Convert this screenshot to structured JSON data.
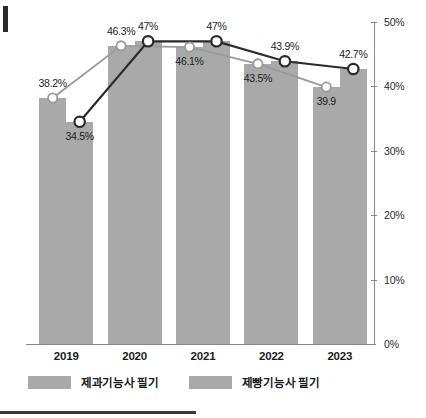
{
  "chart_data": {
    "type": "bar",
    "title": "",
    "subtitle": "",
    "xlabel": "",
    "ylabel": "",
    "categories": [
      "2019",
      "2020",
      "2021",
      "2022",
      "2023"
    ],
    "ylim": [
      0,
      50
    ],
    "ytick_labels": [
      "0%",
      "10%",
      "20%",
      "30%",
      "40%",
      "50%"
    ],
    "ytick_values": [
      0,
      10,
      20,
      30,
      40,
      50
    ],
    "grid": false,
    "legend_position": "bottom-left",
    "series": [
      {
        "name": "제과기능사 필기",
        "color": "#9a9a9a",
        "values": [
          38.2,
          46.3,
          46.1,
          43.5,
          39.9
        ],
        "labels": [
          "38.2%",
          "46.3%",
          "46.1%",
          "43.5%",
          "39.9"
        ]
      },
      {
        "name": "제빵기능사 필기",
        "color": "#2b2b2b",
        "values": [
          34.5,
          47,
          47,
          43.9,
          42.7
        ],
        "labels": [
          "34.5%",
          "47%",
          "47%",
          "43.9%",
          "42.7%"
        ]
      }
    ],
    "bar_color": "#a9a9a9"
  },
  "legend": {
    "items": [
      {
        "label": "제과기능사 필기"
      },
      {
        "label": "제빵기능사 필기"
      }
    ]
  },
  "axis": {
    "y_labels": [
      "50%",
      "40%",
      "30%",
      "20%",
      "10%",
      "0%"
    ]
  }
}
